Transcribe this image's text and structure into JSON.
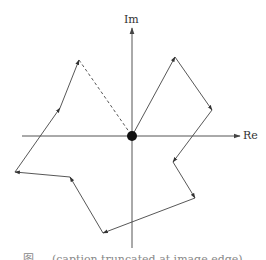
{
  "figure": {
    "axes": {
      "x_label": "Re",
      "y_label": "Im",
      "origin": [
        132,
        136
      ]
    },
    "colors": {
      "line": "#444444",
      "axis": "#555555",
      "origin_dot": "#111111"
    },
    "path_vertices": [
      [
        132,
        136
      ],
      [
        175,
        57
      ],
      [
        212,
        110
      ],
      [
        173,
        162
      ],
      [
        195,
        198
      ],
      [
        103,
        233
      ],
      [
        70,
        177
      ],
      [
        15,
        172
      ],
      [
        79,
        60
      ]
    ],
    "closing_segment": {
      "from": [
        79,
        60
      ],
      "to": [
        132,
        136
      ],
      "style": "dashed"
    },
    "caption": "图 ... (caption truncated at image edge)"
  }
}
